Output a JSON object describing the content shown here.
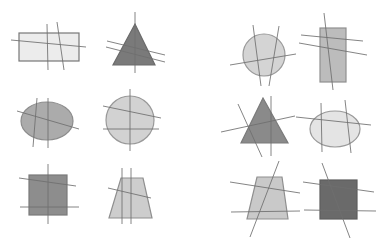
{
  "figure": {
    "width": 385,
    "height": 242,
    "background": "#ffffff",
    "line_color": "#6e6e6e",
    "border_color": "#8a8a8a",
    "panels": [
      {
        "name": "left-panel",
        "shapes": [
          {
            "id": "rectangle",
            "type": "rect",
            "x": 19,
            "y": 33,
            "w": 60,
            "h": 28,
            "fill": "#ececec",
            "stroke": "#777777",
            "lines": [
              [
                11,
                40,
                86,
                47
              ],
              [
                47,
                24,
                48,
                70
              ],
              [
                57,
                22,
                64,
                70
              ]
            ]
          },
          {
            "id": "triangle",
            "type": "polygon",
            "points": "135,24 113,65 155,65",
            "fill": "#7a7a7a",
            "stroke": "#6a6a6a",
            "lines": [
              [
                135,
                12,
                135,
                73
              ],
              [
                107,
                41,
                165,
                55
              ],
              [
                106,
                47,
                165,
                62
              ]
            ]
          },
          {
            "id": "ellipse",
            "type": "ellipse",
            "cx": 47,
            "cy": 121,
            "rx": 26,
            "ry": 19,
            "fill": "#ababab",
            "stroke": "#8c8c8c",
            "lines": [
              [
                17,
                111,
                79,
                129
              ],
              [
                37,
                98,
                33,
                147
              ],
              [
                48,
                98,
                48,
                148
              ]
            ]
          },
          {
            "id": "circle",
            "type": "circle",
            "cx": 130,
            "cy": 120,
            "r": 24,
            "fill": "#d2d2d2",
            "stroke": "#999999",
            "lines": [
              [
                103,
                106,
                161,
                118
              ],
              [
                103,
                129,
                159,
                129
              ],
              [
                130,
                89,
                130,
                151
              ]
            ]
          },
          {
            "id": "square",
            "type": "rect",
            "x": 29,
            "y": 175,
            "w": 38,
            "h": 40,
            "fill": "#8d8d8d",
            "stroke": "#7a7a7a",
            "lines": [
              [
                19,
                178,
                76,
                186
              ],
              [
                20,
                207,
                79,
                207
              ],
              [
                48,
                164,
                48,
                224
              ]
            ]
          },
          {
            "id": "trapezoid",
            "type": "polygon",
            "points": "121,178 143,178 152,218 109,218",
            "fill": "#cdcdcd",
            "stroke": "#8f8f8f",
            "lines": [
              [
                122,
                168,
                122,
                224
              ],
              [
                131,
                168,
                131,
                224
              ],
              [
                108,
                188,
                151,
                198
              ]
            ]
          }
        ]
      },
      {
        "name": "right-panel",
        "shapes": [
          {
            "id": "circle",
            "type": "circle",
            "cx": 264,
            "cy": 55,
            "r": 21,
            "fill": "#d4d4d4",
            "stroke": "#999999",
            "lines": [
              [
                230,
                65,
                296,
                54
              ],
              [
                253,
                25,
                261,
                86
              ],
              [
                279,
                26,
                269,
                86
              ]
            ]
          },
          {
            "id": "rectangle",
            "type": "rect",
            "x": 320,
            "y": 28,
            "w": 26,
            "h": 54,
            "fill": "#bcbcbc",
            "stroke": "#909090",
            "lines": [
              [
                301,
                35,
                363,
                41
              ],
              [
                299,
                43,
                367,
                55
              ],
              [
                324,
                13,
                333,
                90
              ]
            ]
          },
          {
            "id": "triangle",
            "type": "polygon",
            "points": "263,98 241,143 288,143",
            "fill": "#8a8a8a",
            "stroke": "#7a7a7a",
            "lines": [
              [
                221,
                132,
                295,
                116
              ],
              [
                238,
                104,
                262,
                157
              ],
              [
                271,
                96,
                271,
                156
              ]
            ]
          },
          {
            "id": "ellipse",
            "type": "ellipse",
            "cx": 335,
            "cy": 129,
            "rx": 25,
            "ry": 18,
            "fill": "#e4e4e4",
            "stroke": "#999999",
            "lines": [
              [
                296,
                117,
                371,
                125
              ],
              [
                321,
                103,
                322,
                152
              ],
              [
                345,
                100,
                351,
                153
              ]
            ]
          },
          {
            "id": "trapezoid",
            "type": "polygon",
            "points": "257,177 282,177 288,219 247,219",
            "fill": "#c9c9c9",
            "stroke": "#8f8f8f",
            "lines": [
              [
                230,
                182,
                300,
                193
              ],
              [
                231,
                212,
                300,
                211
              ],
              [
                279,
                161,
                250,
                237
              ]
            ]
          },
          {
            "id": "square",
            "type": "rect",
            "x": 320,
            "y": 180,
            "w": 37,
            "h": 39,
            "fill": "#6a6a6a",
            "stroke": "#5e5e5e",
            "lines": [
              [
                303,
                182,
                374,
                192
              ],
              [
                304,
                210,
                376,
                211
              ],
              [
                322,
                163,
                350,
                238
              ]
            ]
          }
        ]
      }
    ]
  }
}
